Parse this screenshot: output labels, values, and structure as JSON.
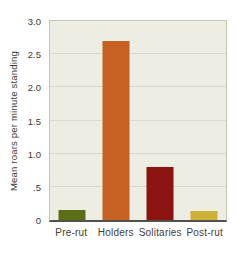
{
  "chart_data": {
    "type": "bar",
    "title": "",
    "xlabel": "",
    "ylabel": "Mean roars per minute standing",
    "categories": [
      "Pre-rut",
      "Holders",
      "Solitaries",
      "Post-rut"
    ],
    "values": [
      0.15,
      2.7,
      0.8,
      0.13
    ],
    "bar_colors": [
      "#5c6e16",
      "#c66023",
      "#8c1410",
      "#cdb138"
    ],
    "ylim": [
      0,
      3.0
    ],
    "yticks": [
      {
        "value": 0,
        "label": "0"
      },
      {
        "value": 0.5,
        "label": ".5"
      },
      {
        "value": 1.0,
        "label": "1.0"
      },
      {
        "value": 1.5,
        "label": "1.5"
      },
      {
        "value": 2.0,
        "label": "2.0"
      },
      {
        "value": 2.5,
        "label": "2.5"
      },
      {
        "value": 3.0,
        "label": "3.0"
      }
    ],
    "grid": true,
    "legend": false,
    "colors": {
      "plot_background": "#eeede3",
      "grid_color": "#d9d8c9",
      "border_color": "#c7c6b3",
      "axis_line_color": "#53524a",
      "text_color": "#3a3a36"
    }
  }
}
